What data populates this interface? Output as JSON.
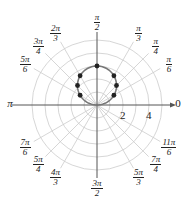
{
  "chart_data": {
    "type": "polar",
    "title": "",
    "equation": "r = 3 sin θ",
    "center_px": [
      97,
      105
    ],
    "unit_px": 13,
    "rings": [
      1,
      2,
      3,
      4,
      5
    ],
    "radial_tick_labels": [
      {
        "value": 2,
        "label": "2"
      },
      {
        "value": 4,
        "label": "4"
      }
    ],
    "angle_labels": [
      {
        "angle": 0,
        "num": "0",
        "den": ""
      },
      {
        "angle": 30,
        "num": "π",
        "den": "6"
      },
      {
        "angle": 45,
        "num": "π",
        "den": "4"
      },
      {
        "angle": 60,
        "num": "π",
        "den": "3"
      },
      {
        "angle": 90,
        "num": "π",
        "den": "2"
      },
      {
        "angle": 120,
        "num": "2π",
        "den": "3"
      },
      {
        "angle": 135,
        "num": "3π",
        "den": "4"
      },
      {
        "angle": 150,
        "num": "5π",
        "den": "6"
      },
      {
        "angle": 180,
        "num": "π",
        "den": ""
      },
      {
        "angle": 210,
        "num": "7π",
        "den": "6"
      },
      {
        "angle": 225,
        "num": "5π",
        "den": "4"
      },
      {
        "angle": 240,
        "num": "4π",
        "den": "3"
      },
      {
        "angle": 270,
        "num": "3π",
        "den": "2"
      },
      {
        "angle": 300,
        "num": "5π",
        "den": "3"
      },
      {
        "angle": 315,
        "num": "7π",
        "den": "4"
      },
      {
        "angle": 330,
        "num": "11π",
        "den": "6"
      }
    ],
    "points": [
      {
        "theta": "π/6",
        "r": 1.5
      },
      {
        "theta": "π/4",
        "r": 2.12
      },
      {
        "theta": "π/3",
        "r": 2.6
      },
      {
        "theta": "π/2",
        "r": 3
      },
      {
        "theta": "2π/3",
        "r": 2.6
      },
      {
        "theta": "3π/4",
        "r": 2.12
      },
      {
        "theta": "5π/6",
        "r": 1.5
      }
    ],
    "colors": {
      "grid": "#cccccc",
      "axis": "#555555",
      "curve": "#777777",
      "point": "#222222"
    }
  }
}
